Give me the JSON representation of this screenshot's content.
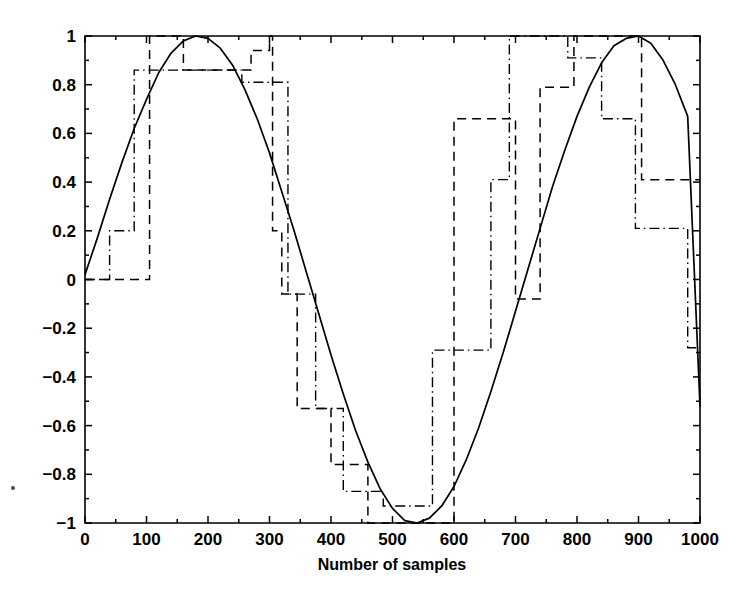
{
  "chart_data": {
    "type": "line",
    "title": "",
    "subtitle": "",
    "xlabel": "Number of samples",
    "ylabel": "",
    "xlim": [
      0,
      1000
    ],
    "ylim": [
      -1,
      1
    ],
    "grid": false,
    "legend": "none",
    "x_ticks": [
      0,
      100,
      200,
      300,
      400,
      500,
      600,
      700,
      800,
      900,
      1000
    ],
    "x_tick_labels": [
      "0",
      "100",
      "200",
      "300",
      "400",
      "500",
      "600",
      "700",
      "800",
      "900",
      "1000"
    ],
    "y_ticks": [
      -1,
      -0.8,
      -0.6,
      -0.4,
      -0.2,
      0,
      0.2,
      0.4,
      0.6,
      0.8,
      1
    ],
    "y_tick_labels": [
      "−1",
      "−0.8",
      "−0.6",
      "−0.4",
      "−0.2",
      "0",
      "0.2",
      "0.4",
      "0.6",
      "0.8",
      "1"
    ],
    "x_minor_ticks": [
      50,
      150,
      250,
      350,
      450,
      550,
      650,
      750,
      850,
      950
    ],
    "y_minor_ticks": [
      -0.9,
      -0.7,
      -0.5,
      -0.3,
      -0.1,
      0.1,
      0.3,
      0.5,
      0.7,
      0.9
    ],
    "series": [
      {
        "name": "reference sine",
        "style": "solid",
        "line_style": "-",
        "color": "#000000",
        "description": "Continuous reference sine wave, amplitude 1, about 1.3 periods across 1000 samples",
        "x": [
          0,
          20,
          40,
          60,
          80,
          100,
          120,
          140,
          160,
          180,
          200,
          220,
          240,
          260,
          280,
          300,
          320,
          340,
          360,
          380,
          400,
          420,
          440,
          460,
          480,
          500,
          520,
          540,
          560,
          580,
          600,
          620,
          640,
          660,
          680,
          700,
          720,
          740,
          760,
          780,
          800,
          820,
          840,
          860,
          880,
          900,
          920,
          940,
          960,
          980,
          1000
        ],
        "y": [
          0.02,
          0.17,
          0.33,
          0.48,
          0.62,
          0.74,
          0.85,
          0.93,
          0.98,
          1.0,
          0.99,
          0.95,
          0.88,
          0.78,
          0.66,
          0.52,
          0.36,
          0.2,
          0.03,
          -0.14,
          -0.31,
          -0.47,
          -0.62,
          -0.75,
          -0.86,
          -0.94,
          -0.99,
          -1.0,
          -0.98,
          -0.93,
          -0.85,
          -0.74,
          -0.61,
          -0.46,
          -0.3,
          -0.13,
          0.04,
          0.21,
          0.38,
          0.53,
          0.67,
          0.79,
          0.89,
          0.96,
          0.99,
          1.0,
          0.97,
          0.9,
          0.8,
          0.67,
          -0.52
        ]
      },
      {
        "name": "quantized step tracker A",
        "style": "dashed",
        "line_style": "--",
        "color": "#000000",
        "description": "Staircase approximation updating in discrete held levels",
        "steps_x": [
          0,
          105,
          105,
          160,
          160,
          270,
          270,
          300,
          300,
          305,
          305,
          320,
          320,
          345,
          345,
          400,
          400,
          420,
          420,
          460,
          460,
          600,
          600,
          615,
          615,
          700,
          700,
          740,
          740,
          795,
          795,
          860,
          860,
          905,
          905,
          955,
          955,
          1000
        ],
        "steps_y": [
          0.0,
          0.0,
          1.0,
          1.0,
          0.86,
          0.86,
          0.94,
          0.94,
          1.0,
          1.0,
          0.2,
          0.2,
          -0.06,
          -0.06,
          -0.53,
          -0.53,
          -0.76,
          -0.76,
          -0.76,
          -0.76,
          -1.0,
          -1.0,
          0.66,
          0.66,
          0.66,
          0.66,
          -0.08,
          -0.08,
          0.79,
          0.79,
          1.0,
          1.0,
          1.0,
          1.0,
          0.41,
          0.41,
          0.41,
          0.41
        ]
      },
      {
        "name": "quantized step tracker B",
        "style": "dash-dot",
        "line_style": "-.",
        "color": "#000000",
        "description": "Second staircase approximation with different update instants",
        "steps_x": [
          0,
          40,
          40,
          80,
          80,
          150,
          150,
          255,
          255,
          300,
          300,
          330,
          330,
          375,
          375,
          420,
          420,
          485,
          485,
          565,
          565,
          600,
          600,
          660,
          660,
          690,
          690,
          785,
          785,
          840,
          840,
          895,
          895,
          980,
          980,
          1000
        ],
        "steps_y": [
          0.0,
          0.0,
          0.2,
          0.2,
          0.86,
          0.86,
          0.86,
          0.86,
          0.81,
          0.81,
          0.81,
          0.81,
          -0.06,
          -0.06,
          -0.53,
          -0.53,
          -0.87,
          -0.87,
          -0.93,
          -0.93,
          -0.29,
          -0.29,
          -0.29,
          -0.29,
          0.41,
          0.41,
          1.0,
          1.0,
          0.91,
          0.91,
          0.66,
          0.66,
          0.21,
          0.21,
          -0.28,
          -0.28
        ]
      }
    ],
    "annotations": []
  },
  "figure": {
    "background_color": "#ffffff",
    "foreground_color": "#000000",
    "x_axis_title": "Number of samples"
  }
}
